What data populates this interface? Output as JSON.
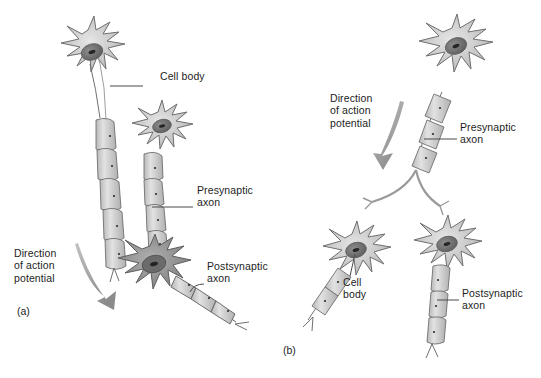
{
  "figure": {
    "background_color": "#ffffff",
    "ink_color": "#5a5a5a",
    "soma_fill_light": "#c9c9c9",
    "soma_fill_dark": "#8f8f8f",
    "nucleus_color": "#6e6e6e",
    "nucleolus_color": "#2b2b2b",
    "arrow_color": "#9a9a9a",
    "leader_color": "#4a4a4a"
  },
  "panels": [
    {
      "id": "panel-a",
      "label": "(a)",
      "label_pos": {
        "x": 17,
        "y": 311
      },
      "description": "Two presynaptic neurons converge on one postsynaptic neuron",
      "annotations": [
        {
          "name": "cell-body",
          "text": "Cell body",
          "pos": {
            "x": 160,
            "y": 76
          },
          "leader": {
            "x1": 143,
            "y1": 86,
            "x2": 110,
            "y2": 86
          }
        },
        {
          "name": "presynaptic-axon",
          "text": "Presynaptic\naxon",
          "pos": {
            "x": 197,
            "y": 190
          },
          "leader": {
            "x1": 193,
            "y1": 207,
            "x2": 152,
            "y2": 207
          }
        },
        {
          "name": "postsynaptic-axon",
          "text": "Postsynaptic\naxon",
          "pos": {
            "x": 207,
            "y": 266
          },
          "leader": {
            "x1": 204,
            "y1": 283,
            "x2": 190,
            "y2": 290
          }
        },
        {
          "name": "direction-of-action-potential",
          "text": "Direction\nof action\npotential",
          "pos": {
            "x": 14,
            "y": 253
          },
          "leader": null
        }
      ]
    },
    {
      "id": "panel-b",
      "label": "(b)",
      "label_pos": {
        "x": 283,
        "y": 350
      },
      "description": "One presynaptic neuron with a branching axon diverges onto two postsynaptic neurons",
      "annotations": [
        {
          "name": "direction-of-action-potential",
          "text": "Direction\nof action\npotential",
          "pos": {
            "x": 330,
            "y": 98
          },
          "leader": null
        },
        {
          "name": "presynaptic-axon",
          "text": "Presynaptic\naxon",
          "pos": {
            "x": 460,
            "y": 127
          },
          "leader": {
            "x1": 457,
            "y1": 139,
            "x2": 424,
            "y2": 139
          }
        },
        {
          "name": "cell-body",
          "text": "Cell\nbody",
          "pos": {
            "x": 345,
            "y": 281
          },
          "leader": {
            "x1": 348,
            "y1": 278,
            "x2": 352,
            "y2": 253
          }
        },
        {
          "name": "postsynaptic-axon",
          "text": "Postsynaptic\naxon",
          "pos": {
            "x": 462,
            "y": 293
          },
          "leader": {
            "x1": 459,
            "y1": 300,
            "x2": 437,
            "y2": 300
          }
        }
      ]
    }
  ]
}
